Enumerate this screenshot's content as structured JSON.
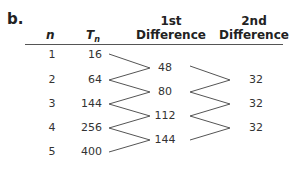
{
  "label": "b.",
  "table": {
    "headers": {
      "n": "n",
      "t": "T",
      "t_sub": "n",
      "first_diff_line1": "1st",
      "first_diff_line2": "Difference",
      "second_diff_line1": "2nd",
      "second_diff_line2": "Difference"
    },
    "n_values": [
      "1",
      "2",
      "3",
      "4",
      "5"
    ],
    "t_values": [
      "16",
      "64",
      "144",
      "256",
      "400"
    ],
    "first_differences": [
      "48",
      "80",
      "112",
      "144"
    ],
    "second_differences": [
      "32",
      "32",
      "32"
    ]
  }
}
